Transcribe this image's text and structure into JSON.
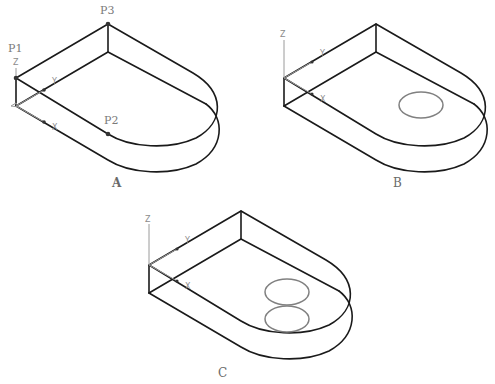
{
  "figures": [
    {
      "id": "A",
      "label": "A",
      "points": [
        {
          "name": "P1",
          "label": "P1"
        },
        {
          "name": "P2",
          "label": "P2"
        },
        {
          "name": "P3",
          "label": "P3"
        }
      ],
      "axes": {
        "z": "Z",
        "y": "Y",
        "x": "X"
      },
      "circles": 0
    },
    {
      "id": "B",
      "label": "B",
      "axes": {
        "z": "Z",
        "y": "Y",
        "x": "X"
      },
      "circles": 1
    },
    {
      "id": "C",
      "label": "C",
      "axes": {
        "z": "Z",
        "y": "Y",
        "x": "X"
      },
      "circles": 2
    }
  ],
  "colors": {
    "edge": "#1a1a1a",
    "circle": "#808080",
    "label": "#7a7a7a"
  }
}
